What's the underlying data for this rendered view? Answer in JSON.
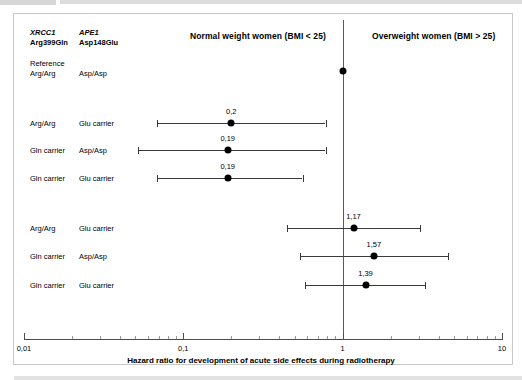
{
  "figure": {
    "columns": {
      "gene1": "XRCC1",
      "polymorphism1": "Arg399Gln",
      "gene2": "APE1",
      "polymorphism2": "Asp148Glu"
    },
    "panels": {
      "left_title": "Normal weight women (BMI < 25)",
      "right_title": "Overweight women (BMI > 25)"
    },
    "reference": {
      "word": "Reference",
      "genotype1": "Arg/Arg",
      "genotype2": "Asp/Asp"
    }
  },
  "chart_data": {
    "type": "scatter",
    "title": "",
    "xlabel": "Hazard ratio for development of acute side effects during radiotherapy",
    "ylabel": "",
    "xscale": "log",
    "xlim": [
      0.01,
      10
    ],
    "tick_labels": [
      "0,01",
      "0,1",
      "1",
      "10"
    ],
    "tick_values": [
      0.01,
      0.1,
      1,
      10
    ],
    "grid": false,
    "legend": "none",
    "null_value": 1,
    "reference_point": {
      "label_word": "Reference",
      "genotype_xrcc1": "Arg/Arg",
      "genotype_ape1": "Asp/Asp",
      "value": 1,
      "value_label": ""
    },
    "groups": [
      {
        "name": "Normal weight women (BMI < 25)",
        "rows": [
          {
            "genotype_xrcc1": "Arg/Arg",
            "genotype_ape1": "Glu carrier",
            "hr": 0.2,
            "hr_label": "0,2",
            "ci_low": 0.068,
            "ci_high": 0.78
          },
          {
            "genotype_xrcc1": "Gln carrier",
            "genotype_ape1": "Asp/Asp",
            "hr": 0.19,
            "hr_label": "0,19",
            "ci_low": 0.052,
            "ci_high": 0.78
          },
          {
            "genotype_xrcc1": "Gln carrier",
            "genotype_ape1": "Glu carrier",
            "hr": 0.19,
            "hr_label": "0,19",
            "ci_low": 0.068,
            "ci_high": 0.56
          }
        ]
      },
      {
        "name": "Overweight women (BMI > 25)",
        "rows": [
          {
            "genotype_xrcc1": "Arg/Arg",
            "genotype_ape1": "Glu carrier",
            "hr": 1.17,
            "hr_label": "1,17",
            "ci_low": 0.45,
            "ci_high": 3.05
          },
          {
            "genotype_xrcc1": "Gln carrier",
            "genotype_ape1": "Asp/Asp",
            "hr": 1.57,
            "hr_label": "1,57",
            "ci_low": 0.54,
            "ci_high": 4.55
          },
          {
            "genotype_xrcc1": "Gln carrier",
            "genotype_ape1": "Glu carrier",
            "hr": 1.39,
            "hr_label": "1,39",
            "ci_low": 0.58,
            "ci_high": 3.3
          }
        ]
      }
    ]
  }
}
